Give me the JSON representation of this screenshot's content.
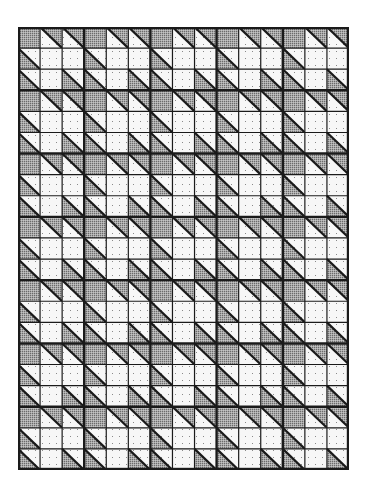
{
  "grid": {
    "columns": 15,
    "rows": 21,
    "block_size": 3
  },
  "colors": {
    "background": "#ffffff",
    "gray_fill": "#a9a9a9",
    "gray_dot": "#6b6b6b",
    "light_fill": "#f7f7f7",
    "light_dot": "#8a8a8a",
    "line": "#1a1a1a"
  },
  "legend": {
    "G": "solid gray square",
    "D": "solid dotted light square",
    "U": "half-square triangle, upper-right gray / lower-left dotted",
    "L": "half-square triangle, lower-left gray / upper-right dotted"
  },
  "block_pattern": [
    [
      "G",
      "U",
      "U"
    ],
    [
      "L",
      "D",
      "D"
    ],
    [
      "L",
      "D",
      "L"
    ]
  ]
}
